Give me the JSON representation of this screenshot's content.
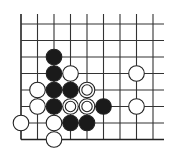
{
  "diagram": {
    "type": "go-board-fragment",
    "corner": "bottom-left",
    "grid": {
      "columns": 9,
      "rows": 8,
      "col_x": [
        21,
        37.5,
        54,
        70.5,
        87,
        103.5,
        120,
        136.5,
        153
      ],
      "row_y": [
        24,
        40.5,
        57,
        73.5,
        90,
        106.5,
        123,
        139.5
      ],
      "line_top": 14,
      "line_right": 164,
      "line_color": "#333333",
      "edge_color": "#222222"
    },
    "stone_radius": 7.8,
    "colors": {
      "black": "#1a1a1a",
      "white": "#ffffff",
      "outline": "#222222"
    },
    "stones": [
      {
        "color": "black",
        "col": 2,
        "row": 2
      },
      {
        "color": "black",
        "col": 2,
        "row": 3
      },
      {
        "color": "white",
        "col": 3,
        "row": 3
      },
      {
        "color": "white",
        "col": 7,
        "row": 3
      },
      {
        "color": "white",
        "col": 1,
        "row": 4
      },
      {
        "color": "black",
        "col": 2,
        "row": 4
      },
      {
        "color": "black",
        "col": 3,
        "row": 4
      },
      {
        "color": "white",
        "col": 4,
        "row": 4,
        "marked": true
      },
      {
        "color": "white",
        "col": 1,
        "row": 5
      },
      {
        "color": "black",
        "col": 2,
        "row": 5
      },
      {
        "color": "white",
        "col": 3,
        "row": 5,
        "marked": true
      },
      {
        "color": "white",
        "col": 4,
        "row": 5,
        "marked": true
      },
      {
        "color": "black",
        "col": 5,
        "row": 5
      },
      {
        "color": "white",
        "col": 7,
        "row": 5
      },
      {
        "color": "white",
        "col": 0,
        "row": 6
      },
      {
        "color": "white",
        "col": 2,
        "row": 6
      },
      {
        "color": "black",
        "col": 3,
        "row": 6
      },
      {
        "color": "black",
        "col": 4,
        "row": 6
      },
      {
        "color": "white",
        "col": 2,
        "row": 7
      }
    ]
  }
}
